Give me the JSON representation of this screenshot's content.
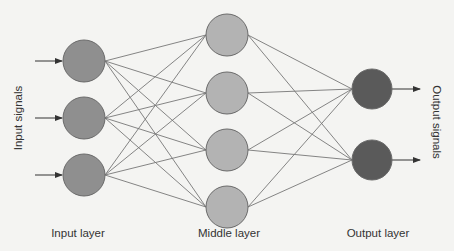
{
  "diagram": {
    "type": "neural-network",
    "labels": {
      "input_signals": "Input signals",
      "output_signals": "Output signals",
      "input_layer": "Input layer",
      "middle_layer": "Middle layer",
      "output_layer": "Output layer"
    },
    "colors": {
      "background": "#f4f4f2",
      "input_node": "#8f8f8f",
      "middle_node": "#b3b3b3",
      "output_node": "#5a5a5a",
      "node_stroke": "#6a6a6a",
      "edge": "#777777",
      "arrow": "#333333"
    },
    "layers": [
      {
        "name": "input",
        "x": 84,
        "r": 21,
        "nodes_y": [
          61,
          118,
          175
        ]
      },
      {
        "name": "middle",
        "x": 227,
        "r": 21,
        "nodes_y": [
          35,
          93,
          150,
          207
        ]
      },
      {
        "name": "output",
        "x": 372,
        "r": 20,
        "nodes_y": [
          89,
          160
        ]
      }
    ],
    "connectivity": "fully-connected"
  }
}
